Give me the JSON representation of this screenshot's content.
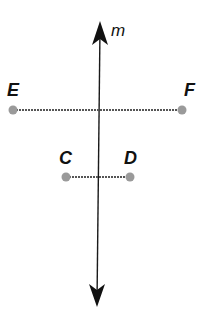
{
  "diagram": {
    "type": "geometry",
    "colors": {
      "line": "#1a1a1a",
      "segment": "#555555",
      "point": "#9a9a9a",
      "label": "#111111",
      "background": "#ffffff"
    },
    "line_m": {
      "label": "m",
      "top": {
        "x": 100,
        "y": 23
      },
      "bottom": {
        "x": 97,
        "y": 307
      },
      "label_pos": {
        "x": 111,
        "y": 36
      },
      "arrows": "both"
    },
    "segments": [
      {
        "name": "EF",
        "points": [
          {
            "label": "E",
            "x": 13,
            "y": 110,
            "label_x": 7,
            "label_y": 96
          },
          {
            "label": "F",
            "x": 182,
            "y": 110,
            "label_x": 184,
            "label_y": 96
          }
        ]
      },
      {
        "name": "CD",
        "points": [
          {
            "label": "C",
            "x": 66,
            "y": 177,
            "label_x": 59,
            "label_y": 164
          },
          {
            "label": "D",
            "x": 130,
            "y": 177,
            "label_x": 124,
            "label_y": 164
          }
        ]
      }
    ]
  }
}
